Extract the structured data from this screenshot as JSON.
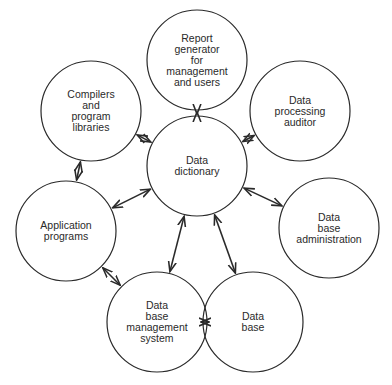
{
  "diagram": {
    "type": "hub-and-spoke",
    "center_node": "data_dictionary",
    "colors": {
      "stroke": "#2a2a2a",
      "text": "#2a2a2a",
      "background": "#ffffff"
    },
    "nodes": [
      {
        "id": "report_generator",
        "lines": [
          "Report",
          "generator",
          "for",
          "management",
          "and  users"
        ],
        "cx": 197,
        "cy": 60,
        "r": 50
      },
      {
        "id": "data_processing_auditor",
        "lines": [
          "Data",
          "processing",
          "auditor"
        ],
        "cx": 300,
        "cy": 111,
        "r": 50
      },
      {
        "id": "compilers",
        "lines": [
          "Compilers",
          "and",
          "program",
          "libraries"
        ],
        "cx": 91,
        "cy": 111,
        "r": 50
      },
      {
        "id": "data_dictionary",
        "lines": [
          "Data",
          "dictionary"
        ],
        "cx": 197,
        "cy": 166,
        "r": 50
      },
      {
        "id": "data_base_administration",
        "lines": [
          "Data",
          "base",
          "administration"
        ],
        "cx": 329,
        "cy": 228,
        "r": 50
      },
      {
        "id": "application_programs",
        "lines": [
          "Application",
          "programs"
        ],
        "cx": 66,
        "cy": 231,
        "r": 50
      },
      {
        "id": "dbms",
        "lines": [
          "Data",
          "base",
          "management",
          "system"
        ],
        "cx": 157,
        "cy": 322,
        "r": 50
      },
      {
        "id": "data_base",
        "lines": [
          "Data",
          "base"
        ],
        "cx": 253,
        "cy": 322,
        "r": 50
      }
    ],
    "edges": [
      {
        "from": "data_dictionary",
        "to": "report_generator",
        "bidirectional": true
      },
      {
        "from": "data_dictionary",
        "to": "data_processing_auditor",
        "bidirectional": true
      },
      {
        "from": "data_dictionary",
        "to": "compilers",
        "bidirectional": true
      },
      {
        "from": "data_dictionary",
        "to": "data_base_administration",
        "bidirectional": true
      },
      {
        "from": "data_dictionary",
        "to": "application_programs",
        "bidirectional": true
      },
      {
        "from": "data_dictionary",
        "to": "dbms",
        "bidirectional": true
      },
      {
        "from": "data_dictionary",
        "to": "data_base",
        "bidirectional": true
      },
      {
        "from": "compilers",
        "to": "application_programs",
        "bidirectional": true
      },
      {
        "from": "application_programs",
        "to": "dbms",
        "bidirectional": true
      },
      {
        "from": "dbms",
        "to": "data_base",
        "bidirectional": true
      }
    ]
  }
}
